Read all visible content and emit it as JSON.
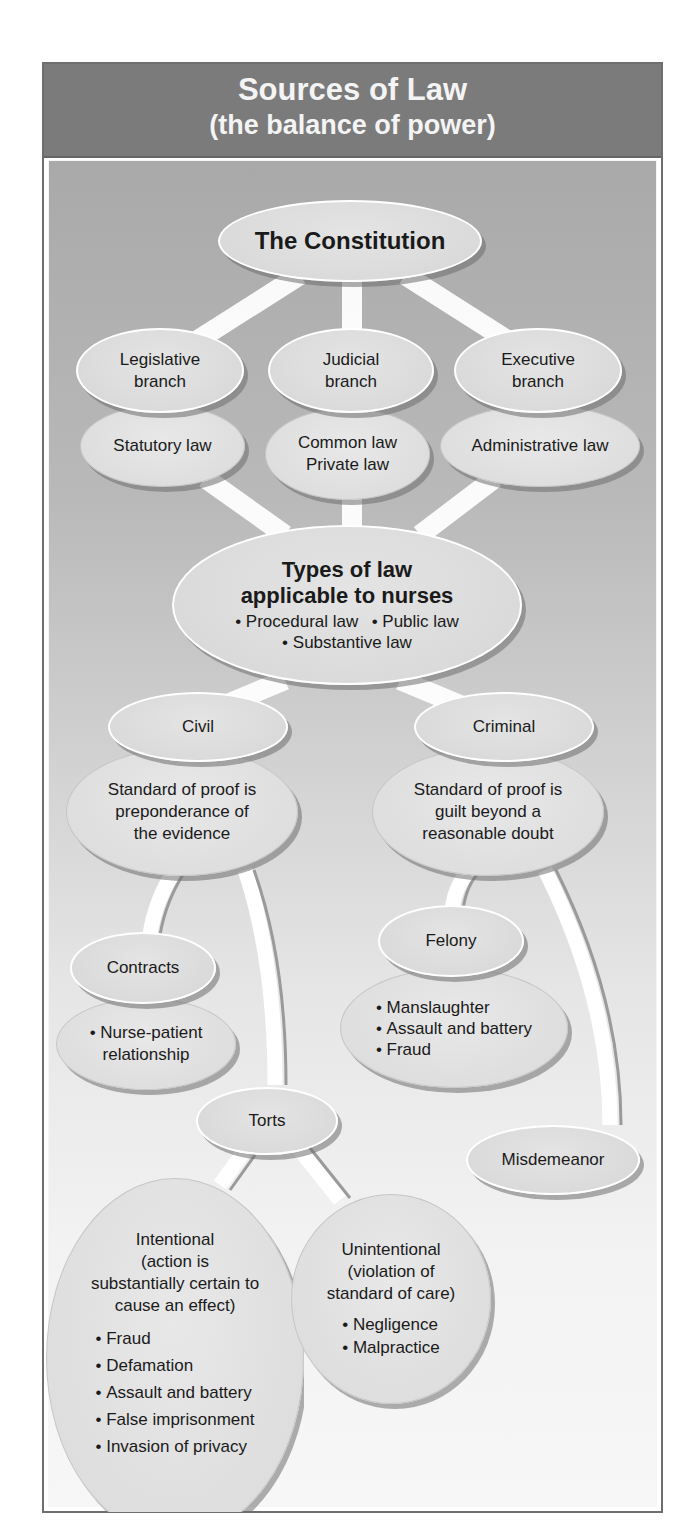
{
  "header": {
    "title": "Sources of Law",
    "subtitle": "(the balance of power)"
  },
  "constitution": {
    "label": "The Constitution"
  },
  "branches": [
    {
      "branch": [
        "Legislative",
        "branch"
      ],
      "law": [
        "Statutory law"
      ]
    },
    {
      "branch": [
        "Judicial",
        "branch"
      ],
      "law": [
        "Common law",
        "Private law"
      ]
    },
    {
      "branch": [
        "Executive",
        "branch"
      ],
      "law": [
        "Administrative law"
      ]
    }
  ],
  "types": {
    "title": [
      "Types of law",
      "applicable to nurses"
    ],
    "items_row1": [
      "Procedural law",
      "Public law"
    ],
    "items_row2": [
      "Substantive law"
    ]
  },
  "civil": {
    "label": "Civil",
    "standard": [
      "Standard of proof is",
      "preponderance of",
      "the evidence"
    ]
  },
  "criminal": {
    "label": "Criminal",
    "standard": [
      "Standard of proof is",
      "guilt beyond a",
      "reasonable doubt"
    ]
  },
  "contracts": {
    "label": "Contracts",
    "items": [
      "Nurse-patient",
      "relationship"
    ]
  },
  "felony": {
    "label": "Felony",
    "items": [
      "Manslaughter",
      "Assault and battery",
      "Fraud"
    ]
  },
  "misdemeanor": {
    "label": "Misdemeanor"
  },
  "torts": {
    "label": "Torts"
  },
  "intentional": {
    "title": [
      "Intentional",
      "(action is",
      "substantially certain to",
      "cause an effect)"
    ],
    "items": [
      "Fraud",
      "Defamation",
      "Assault and battery",
      "False imprisonment",
      "Invasion of privacy"
    ]
  },
  "unintentional": {
    "title": [
      "Unintentional",
      "(violation of",
      "standard of care)"
    ],
    "items": [
      "Negligence",
      "Malpractice"
    ]
  },
  "colors": {
    "header_bg": "#7b7b7b",
    "header_text": "#f4f4f4",
    "body_top": "#a9a9a9",
    "body_bottom": "#f7f7f7",
    "oval_fill": "#dcdcdc",
    "connector": "#ffffff"
  }
}
